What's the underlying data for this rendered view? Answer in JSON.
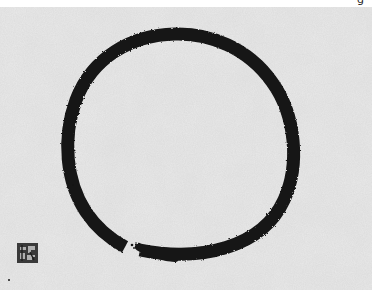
{
  "image": {
    "subject": "Ensō (Zen brush circle) ink painting",
    "description": "Black ink circle brushed on textured gray paper with small square seal at lower left",
    "caption_fragment": "g",
    "colors": {
      "paper": "#e9e9e9",
      "ink": "#141414",
      "seal": "#3a3a3a",
      "border": "#ffffff"
    },
    "circle": {
      "center_x": 179,
      "center_y": 146,
      "radius_x": 110,
      "radius_y": 111,
      "stroke_width": 13,
      "gap_start_label": "brush start at lower-left",
      "gap_end_label": "brush end at bottom"
    },
    "seal": {
      "label": "artist seal",
      "x": 17,
      "y": 243
    }
  }
}
